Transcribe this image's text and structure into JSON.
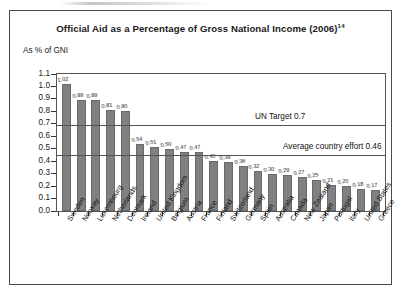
{
  "figure": {
    "title": "Official Aid as a Percentage of Gross National Income (2006)",
    "title_footnote": "14",
    "axis_note": "As % of GNI"
  },
  "chart_data": {
    "type": "bar",
    "title": "Official Aid as a Percentage of Gross National Income (2006)",
    "xlabel": "",
    "ylabel": "As % of GNI",
    "ylim": [
      0.0,
      1.1
    ],
    "ytick_labels": [
      "1.1",
      "1.0",
      "0.9",
      "0.8",
      "0.7",
      "0.6",
      "0.5",
      "0.4",
      "0.3",
      "0.2",
      "0.1",
      "0.0"
    ],
    "ytick_values": [
      1.1,
      1.0,
      0.9,
      0.8,
      0.7,
      0.6,
      0.5,
      0.4,
      0.3,
      0.2,
      0.1,
      0.0
    ],
    "grid": false,
    "legend": "none",
    "bar_color": "#808080",
    "categories": [
      "Sweden",
      "Norway",
      "Luxembourg",
      "Netherlands",
      "Denmark",
      "Ireland",
      "United Kingdom",
      "Belgium",
      "Austria",
      "France",
      "Finland",
      "Switzerland",
      "Germany",
      "Spain",
      "Australia",
      "Canada",
      "New Zealand",
      "Japan",
      "Portugal",
      "Italy",
      "United States",
      "Greece"
    ],
    "values": [
      1.02,
      0.89,
      0.89,
      0.81,
      0.8,
      0.54,
      0.51,
      0.5,
      0.47,
      0.47,
      0.4,
      0.39,
      0.36,
      0.32,
      0.3,
      0.29,
      0.27,
      0.25,
      0.21,
      0.2,
      0.18,
      0.17
    ],
    "value_labels": [
      "1.02",
      "0.89",
      "0.89",
      "0.81",
      "0.80",
      "0.54",
      "0.51",
      "0.50",
      "0.47",
      "0.47",
      "0.40",
      "0.39",
      "0.36",
      "0.32",
      "0.30",
      "0.29",
      "0.27",
      "0.25",
      "0.21",
      "0.20",
      "0.18",
      "0.17"
    ],
    "annotations": [
      {
        "label": "UN Target 0.7",
        "value": 0.7,
        "type": "reference-line"
      },
      {
        "label": "Average country effort 0.46",
        "value": 0.46,
        "type": "reference-line"
      }
    ]
  }
}
